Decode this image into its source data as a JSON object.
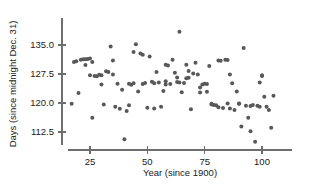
{
  "chart_data": {
    "type": "scatter",
    "title": "",
    "xlabel": "Year (since 1900)",
    "ylabel": "Days (since midnight Dec. 31)",
    "xlim": [
      14,
      108
    ],
    "ylim": [
      108.5,
      139.5
    ],
    "xticks": [
      25,
      50,
      75,
      100
    ],
    "yticks": [
      112.5,
      120.0,
      127.5,
      135.0
    ],
    "xtick_labels": [
      "25",
      "50",
      "75",
      "100"
    ],
    "ytick_labels": [
      "112.5",
      "120.0",
      "127.5",
      "135.0"
    ],
    "grid": false,
    "legend": false,
    "marker_color": "#585858",
    "axis_color": "#6e6e6e",
    "points": [
      [
        17,
        119.8
      ],
      [
        18,
        130.6
      ],
      [
        19,
        130.8
      ],
      [
        20,
        122.6
      ],
      [
        21,
        131.2
      ],
      [
        22,
        131.3
      ],
      [
        23,
        131.3
      ],
      [
        24,
        131.4
      ],
      [
        25,
        131.5
      ],
      [
        25,
        127.2
      ],
      [
        26,
        130.6
      ],
      [
        26,
        116.2
      ],
      [
        27,
        127.0
      ],
      [
        28,
        126.9
      ],
      [
        29,
        127.3
      ],
      [
        30,
        124.8
      ],
      [
        31,
        119.6
      ],
      [
        32,
        128.2
      ],
      [
        33,
        128.0
      ],
      [
        34,
        134.6
      ],
      [
        35,
        131.0
      ],
      [
        36,
        119.0
      ],
      [
        37,
        125.0
      ],
      [
        38,
        118.5
      ],
      [
        39,
        123.4
      ],
      [
        40,
        110.6
      ],
      [
        41,
        117.9
      ],
      [
        42,
        119.4
      ],
      [
        43,
        124.7
      ],
      [
        44,
        133.2
      ],
      [
        45,
        135.2
      ],
      [
        46,
        123.0
      ],
      [
        47,
        132.8
      ],
      [
        48,
        132.5
      ],
      [
        49,
        125.2
      ],
      [
        50,
        118.8
      ],
      [
        51,
        132.0
      ],
      [
        52,
        125.5
      ],
      [
        53,
        118.6
      ],
      [
        54,
        128.0
      ],
      [
        55,
        125.3
      ],
      [
        56,
        119.0
      ],
      [
        57,
        123.1
      ],
      [
        58,
        125.6
      ],
      [
        59,
        129.7
      ],
      [
        60,
        124.9
      ],
      [
        61,
        131.2
      ],
      [
        62,
        127.8
      ],
      [
        63,
        125.4
      ],
      [
        64,
        138.4
      ],
      [
        64,
        125.3
      ],
      [
        65,
        122.8
      ],
      [
        66,
        125.2
      ],
      [
        67,
        129.9
      ],
      [
        68,
        128.3
      ],
      [
        69,
        118.4
      ],
      [
        70,
        127.6
      ],
      [
        71,
        130.4
      ],
      [
        72,
        127.4
      ],
      [
        73,
        122.7
      ],
      [
        74,
        124.8
      ],
      [
        75,
        125.0
      ],
      [
        76,
        124.9
      ],
      [
        76,
        122.9
      ],
      [
        77,
        129.6
      ],
      [
        78,
        119.6
      ],
      [
        79,
        119.5
      ],
      [
        80,
        119.4
      ],
      [
        81,
        131.0
      ],
      [
        82,
        130.9
      ],
      [
        83,
        118.7
      ],
      [
        84,
        131.2
      ],
      [
        85,
        131.1
      ],
      [
        86,
        127.4
      ],
      [
        87,
        125.1
      ],
      [
        88,
        118.2
      ],
      [
        89,
        123.0
      ],
      [
        90,
        119.8
      ],
      [
        91,
        113.9
      ],
      [
        92,
        134.2
      ],
      [
        93,
        119.3
      ],
      [
        94,
        116.2
      ],
      [
        95,
        112.7
      ],
      [
        96,
        119.5
      ],
      [
        97,
        110.0
      ],
      [
        98,
        119.3
      ],
      [
        99,
        125.3
      ],
      [
        100,
        127.0
      ],
      [
        100,
        127.2
      ],
      [
        101,
        121.6
      ],
      [
        102,
        119.0
      ],
      [
        103,
        118.2
      ],
      [
        104,
        113.6
      ],
      [
        105,
        121.9
      ],
      [
        23,
        129.8
      ],
      [
        30,
        127.2
      ],
      [
        35,
        127.4
      ],
      [
        42,
        125.0
      ],
      [
        48,
        124.9
      ],
      [
        53,
        125.1
      ],
      [
        58,
        124.8
      ],
      [
        63,
        126.6
      ],
      [
        68,
        126.5
      ],
      [
        73,
        124.0
      ],
      [
        78,
        119.8
      ],
      [
        85,
        119.9
      ],
      [
        90,
        119.9
      ],
      [
        95,
        119.2
      ],
      [
        99,
        119.0
      ],
      [
        44,
        125.1
      ],
      [
        58,
        129.9
      ],
      [
        67,
        126.4
      ],
      [
        81,
        118.9
      ],
      [
        86,
        118.6
      ]
    ]
  }
}
